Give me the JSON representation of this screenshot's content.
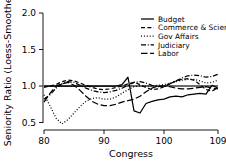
{
  "chart_data": {
    "type": "line",
    "title": "",
    "xlabel": "Congress",
    "ylabel": "Seniority Ratio (Loess-Smoother)",
    "xlim": [
      80,
      109
    ],
    "ylim": [
      0.5,
      2.0
    ],
    "xticks": [
      80,
      90,
      100,
      109
    ],
    "xtick_labels": [
      "80",
      "90",
      "100",
      "109"
    ],
    "yticks": [
      0.5,
      1.0,
      1.5,
      2.0
    ],
    "ytick_labels": [
      "0.5",
      "1.0",
      "1.5",
      "2.0"
    ],
    "grid": false,
    "reference_line": 1.0,
    "legend_position": "top-right",
    "x": [
      80,
      81,
      82,
      83,
      84,
      85,
      86,
      87,
      88,
      89,
      90,
      91,
      92,
      93,
      94,
      95,
      96,
      97,
      98,
      99,
      100,
      101,
      102,
      103,
      104,
      105,
      106,
      107,
      108,
      109
    ],
    "series": [
      {
        "name": "Budget",
        "linestyle": "solid",
        "values": [
          1.0,
          1.0,
          1.0,
          1.0,
          1.0,
          1.0,
          1.0,
          1.0,
          1.0,
          1.0,
          1.0,
          1.0,
          1.0,
          1.02,
          1.12,
          0.66,
          0.63,
          0.76,
          0.79,
          0.81,
          0.82,
          0.85,
          0.86,
          0.85,
          0.88,
          0.89,
          0.9,
          0.89,
          1.01,
          0.97
        ]
      },
      {
        "name": "Commerce & Scien",
        "linestyle": "dashed",
        "values": [
          0.98,
          1.0,
          1.02,
          1.06,
          1.08,
          1.07,
          1.04,
          1.01,
          0.98,
          0.96,
          0.95,
          0.96,
          0.98,
          1.0,
          1.03,
          1.05,
          1.02,
          0.98,
          0.95,
          0.96,
          0.99,
          1.03,
          1.07,
          1.09,
          1.1,
          1.08,
          1.02,
          0.95,
          0.93,
          0.98
        ]
      },
      {
        "name": "Gov Affairs",
        "linestyle": "dotted",
        "values": [
          0.88,
          0.73,
          0.56,
          0.48,
          0.54,
          0.63,
          0.72,
          0.79,
          0.83,
          0.84,
          0.82,
          0.82,
          0.85,
          0.9,
          0.95,
          0.99,
          1.0,
          1.0,
          1.0,
          1.01,
          1.02,
          1.04,
          1.06,
          1.08,
          1.09,
          1.09,
          1.07,
          1.04,
          1.05,
          1.08
        ]
      },
      {
        "name": "Judiciary",
        "linestyle": "dashdot",
        "values": [
          0.82,
          0.88,
          0.97,
          1.03,
          1.06,
          1.05,
          1.01,
          0.97,
          0.94,
          0.92,
          0.91,
          0.92,
          0.94,
          0.97,
          1.01,
          1.05,
          1.06,
          1.04,
          1.01,
          0.99,
          1.0,
          1.03,
          1.07,
          1.11,
          1.14,
          1.15,
          1.14,
          1.12,
          1.13,
          1.16
        ]
      },
      {
        "name": "Labor",
        "linestyle": "longdash",
        "values": [
          0.78,
          0.9,
          1.0,
          1.03,
          1.05,
          1.01,
          0.94,
          0.86,
          0.79,
          0.75,
          0.73,
          0.73,
          0.75,
          0.78,
          0.8,
          0.82,
          0.86,
          0.92,
          0.97,
          1.0,
          1.0,
          0.99,
          0.97,
          0.96,
          0.96,
          0.97,
          0.98,
          0.99,
          0.97,
          0.96
        ]
      }
    ]
  },
  "legend": {
    "items": [
      {
        "label": "Budget",
        "style": "solid"
      },
      {
        "label": "Commerce & Scien",
        "style": "dashed"
      },
      {
        "label": "Gov Affairs",
        "style": "dotted"
      },
      {
        "label": "Judiciary",
        "style": "dashdot"
      },
      {
        "label": "Labor",
        "style": "longdash"
      }
    ]
  },
  "colors": {
    "foreground": "#000000",
    "background": "#ffffff",
    "reference": "#3d3d3d"
  }
}
